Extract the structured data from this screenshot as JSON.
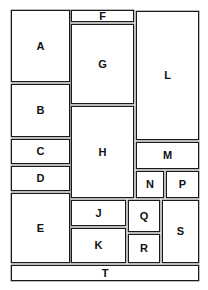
{
  "diagram": {
    "type": "floor-plan-block-layout",
    "boxes": [
      {
        "id": "A",
        "label": "A",
        "x": 11,
        "y": 10,
        "w": 59,
        "h": 72
      },
      {
        "id": "B",
        "label": "B",
        "x": 11,
        "y": 84,
        "w": 59,
        "h": 53
      },
      {
        "id": "C",
        "label": "C",
        "x": 11,
        "y": 139,
        "w": 59,
        "h": 25
      },
      {
        "id": "D",
        "label": "D",
        "x": 11,
        "y": 166,
        "w": 59,
        "h": 25
      },
      {
        "id": "E",
        "label": "E",
        "x": 11,
        "y": 193,
        "w": 59,
        "h": 70
      },
      {
        "id": "F",
        "label": "F",
        "x": 71,
        "y": 10,
        "w": 63,
        "h": 12
      },
      {
        "id": "G",
        "label": "G",
        "x": 71,
        "y": 24,
        "w": 63,
        "h": 80
      },
      {
        "id": "H",
        "label": "H",
        "x": 71,
        "y": 106,
        "w": 63,
        "h": 92
      },
      {
        "id": "J",
        "label": "J",
        "x": 71,
        "y": 200,
        "w": 55,
        "h": 26
      },
      {
        "id": "K",
        "label": "K",
        "x": 71,
        "y": 228,
        "w": 55,
        "h": 35
      },
      {
        "id": "L",
        "label": "L",
        "x": 136,
        "y": 11,
        "w": 63,
        "h": 129
      },
      {
        "id": "M",
        "label": "M",
        "x": 136,
        "y": 142,
        "w": 63,
        "h": 27
      },
      {
        "id": "N",
        "label": "N",
        "x": 136,
        "y": 171,
        "w": 28,
        "h": 27
      },
      {
        "id": "P",
        "label": "P",
        "x": 166,
        "y": 171,
        "w": 33,
        "h": 27
      },
      {
        "id": "Q",
        "label": "Q",
        "x": 128,
        "y": 200,
        "w": 32,
        "h": 32
      },
      {
        "id": "R",
        "label": "R",
        "x": 128,
        "y": 234,
        "w": 32,
        "h": 29
      },
      {
        "id": "S",
        "label": "S",
        "x": 162,
        "y": 200,
        "w": 37,
        "h": 63
      },
      {
        "id": "T",
        "label": "T",
        "x": 11,
        "y": 265,
        "w": 188,
        "h": 16
      }
    ]
  },
  "colors": {
    "border": "#1a1a1a",
    "fill": "#ffffff",
    "text": "#111111"
  }
}
